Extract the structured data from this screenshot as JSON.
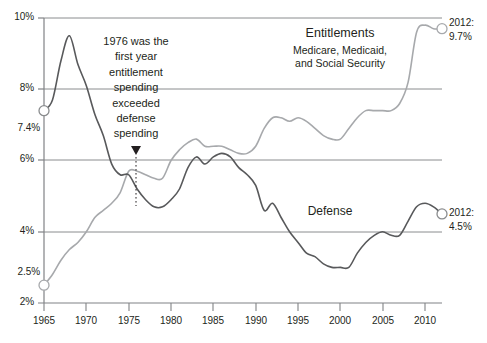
{
  "chart_data": {
    "type": "line",
    "title": "",
    "subtitle": "",
    "xlabel": "",
    "ylabel": "",
    "xlim": [
      1965,
      2012
    ],
    "ylim": [
      2,
      10
    ],
    "grid": true,
    "legend_position": "inline-labels",
    "y_ticks": [
      "10%",
      "8%",
      "6%",
      "4%",
      "2%"
    ],
    "y_tick_values": [
      10,
      8,
      6,
      4,
      2
    ],
    "y_special_labels": [
      {
        "text": "7.4%",
        "value": 7.4
      },
      {
        "text": "2.5%",
        "value": 2.5
      }
    ],
    "x_ticks": [
      "1965",
      "1970",
      "1975",
      "1980",
      "1985",
      "1990",
      "1995",
      "2000",
      "2005",
      "2010"
    ],
    "x_tick_values": [
      1965,
      1970,
      1975,
      1980,
      1985,
      1990,
      1995,
      2000,
      2005,
      2010
    ],
    "x": [
      1965,
      1966,
      1967,
      1968,
      1969,
      1970,
      1971,
      1972,
      1973,
      1974,
      1975,
      1976,
      1977,
      1978,
      1979,
      1980,
      1981,
      1982,
      1983,
      1984,
      1985,
      1986,
      1987,
      1988,
      1989,
      1990,
      1991,
      1992,
      1993,
      1994,
      1995,
      1996,
      1997,
      1998,
      1999,
      2000,
      2001,
      2002,
      2003,
      2004,
      2005,
      2006,
      2007,
      2008,
      2009,
      2010,
      2011,
      2012
    ],
    "series": [
      {
        "name": "Defense",
        "color": "#58595b",
        "start_value": 7.4,
        "end_value": 4.5,
        "values": [
          7.4,
          7.7,
          8.8,
          9.5,
          8.7,
          8.1,
          7.3,
          6.7,
          5.9,
          5.6,
          5.6,
          5.2,
          4.9,
          4.7,
          4.7,
          4.9,
          5.2,
          5.8,
          6.1,
          5.9,
          6.1,
          6.2,
          6.1,
          5.8,
          5.6,
          5.3,
          4.6,
          4.8,
          4.4,
          4.0,
          3.7,
          3.4,
          3.3,
          3.1,
          3.0,
          3.0,
          3.0,
          3.4,
          3.7,
          3.9,
          4.0,
          3.9,
          3.9,
          4.3,
          4.7,
          4.8,
          4.7,
          4.5
        ]
      },
      {
        "name": "Entitlements",
        "color": "#a7a9ac",
        "start_value": 2.5,
        "end_value": 9.7,
        "values": [
          2.5,
          2.8,
          3.2,
          3.5,
          3.7,
          4.0,
          4.4,
          4.6,
          4.8,
          5.1,
          5.7,
          5.7,
          5.6,
          5.5,
          5.5,
          6.0,
          6.3,
          6.5,
          6.6,
          6.4,
          6.4,
          6.4,
          6.3,
          6.2,
          6.2,
          6.4,
          6.9,
          7.2,
          7.2,
          7.1,
          7.2,
          7.1,
          6.9,
          6.7,
          6.6,
          6.6,
          6.9,
          7.2,
          7.4,
          7.4,
          7.4,
          7.4,
          7.6,
          8.2,
          9.6,
          9.8,
          9.7,
          9.7
        ]
      }
    ],
    "annotations": [
      {
        "name": "crossover-note",
        "lines": [
          "1976 was the",
          "first year",
          "entitlement",
          "spending",
          "exceeded",
          "defense",
          "spending"
        ],
        "pointer_year": 1976,
        "pointer_value": 5.6
      }
    ],
    "series_labels": {
      "entitlements_title": "Entitlements",
      "entitlements_sub_line1": "Medicare, Medicaid,",
      "entitlements_sub_line2": "and Social Security",
      "defense_title": "Defense"
    },
    "end_labels": [
      {
        "name": "entitlements-endpoint",
        "year_text": "2012:",
        "value_text": "9.7%"
      },
      {
        "name": "defense-endpoint",
        "year_text": "2012:",
        "value_text": "4.5%"
      }
    ],
    "colors": {
      "defense_line": "#58595b",
      "entitlements_line": "#a7a9ac",
      "gridline": "#808285",
      "axis": "#808285",
      "text": "#231f20",
      "background": "#ffffff"
    }
  }
}
